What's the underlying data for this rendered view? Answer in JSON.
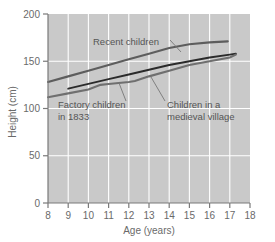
{
  "chart_data": {
    "type": "line",
    "title": "",
    "xlabel": "Age (years)",
    "ylabel": "Height (cm)",
    "xlim": [
      8,
      18
    ],
    "ylim": [
      0,
      200
    ],
    "xticks": [
      "8",
      "9",
      "10",
      "11",
      "12",
      "13",
      "14",
      "15",
      "16",
      "17",
      "18"
    ],
    "yticks": [
      "0",
      "50",
      "100",
      "150",
      "200"
    ],
    "grid": true,
    "legend_position": "inline-annotations",
    "background_color": "#c9c9c9",
    "gridline_color": "#ffffff",
    "series": [
      {
        "name": "Recent children",
        "color": "#5d5d5d",
        "x": [
          8,
          9,
          10,
          11,
          12,
          13,
          14,
          15,
          16,
          16.9
        ],
        "values": [
          128,
          134,
          140,
          146,
          152,
          158,
          164,
          168,
          170,
          171
        ]
      },
      {
        "name": "Factory children in 1833",
        "color": "#2b2b2b",
        "x": [
          9,
          10,
          11,
          12,
          13,
          14,
          15,
          16,
          17,
          17.3
        ],
        "values": [
          121,
          126,
          131,
          136,
          141,
          146,
          150,
          154,
          157,
          158
        ]
      },
      {
        "name": "Children in a medieval village",
        "color": "#6f6f6f",
        "x": [
          8,
          9,
          10,
          10.6,
          11,
          12,
          12.3,
          13,
          14,
          15,
          16,
          17,
          17.3
        ],
        "values": [
          112,
          116,
          120,
          125,
          126,
          128,
          129,
          134,
          140,
          146,
          150,
          154,
          157
        ]
      }
    ],
    "annotations": [
      {
        "id": "recent-children",
        "text_lines": [
          "Recent children"
        ],
        "text_x": 93,
        "text_y": 45,
        "leader": {
          "x1": 170,
          "y1": 40,
          "x2": 181,
          "y2": 52
        }
      },
      {
        "id": "factory-children",
        "text_lines": [
          "Factory children",
          "in 1833"
        ],
        "text_x": 58,
        "text_y": 108,
        "leader": {
          "x1": 126,
          "y1": 101,
          "x2": 119,
          "y2": 83
        }
      },
      {
        "id": "medieval-village",
        "text_lines": [
          "Children in a",
          "medieval village"
        ],
        "text_x": 167,
        "text_y": 108,
        "leader": {
          "x1": 165,
          "y1": 101,
          "x2": 151,
          "y2": 77
        }
      }
    ]
  }
}
